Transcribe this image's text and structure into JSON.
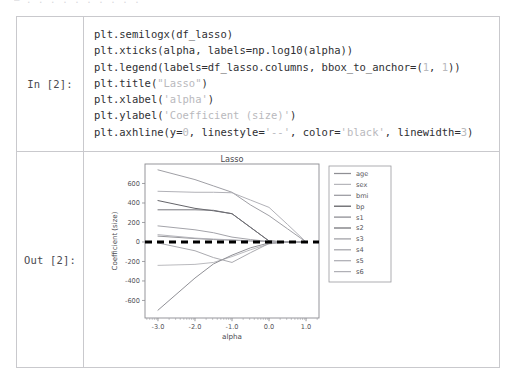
{
  "page": {
    "top_clipped_text": "— . . . . . . . . . ."
  },
  "cell": {
    "input_prompt": "In [2]:",
    "output_prompt": "Out [2]:",
    "code_lines": [
      [
        {
          "t": "plt.semilogx(df_lasso)",
          "k": "plain"
        }
      ],
      [
        {
          "t": "plt.xticks(alpha, labels=np.log10(alpha))",
          "k": "plain"
        }
      ],
      [
        {
          "t": "plt.legend(labels=df_lasso.columns, bbox_to_anchor=(",
          "k": "plain"
        },
        {
          "t": "1",
          "k": "num"
        },
        {
          "t": ", ",
          "k": "plain"
        },
        {
          "t": "1",
          "k": "num"
        },
        {
          "t": "))",
          "k": "plain"
        }
      ],
      [
        {
          "t": "plt.title(",
          "k": "plain"
        },
        {
          "t": "\"Lasso\"",
          "k": "str"
        },
        {
          "t": ")",
          "k": "plain"
        }
      ],
      [
        {
          "t": "plt.xlabel(",
          "k": "plain"
        },
        {
          "t": "'alpha'",
          "k": "str"
        },
        {
          "t": ")",
          "k": "plain"
        }
      ],
      [
        {
          "t": "plt.ylabel(",
          "k": "plain"
        },
        {
          "t": "'Coefficient (size)'",
          "k": "str"
        },
        {
          "t": ")",
          "k": "plain"
        }
      ],
      [
        {
          "t": "plt.axhline(y=",
          "k": "plain"
        },
        {
          "t": "0",
          "k": "num"
        },
        {
          "t": ", linestyle=",
          "k": "plain"
        },
        {
          "t": "'--'",
          "k": "str"
        },
        {
          "t": ", color=",
          "k": "plain"
        },
        {
          "t": "'black'",
          "k": "str"
        },
        {
          "t": ", linewidth=",
          "k": "plain"
        },
        {
          "t": "3",
          "k": "num"
        },
        {
          "t": ")",
          "k": "plain"
        }
      ]
    ]
  },
  "chart_data": {
    "type": "line",
    "title": "Lasso",
    "xlabel": "alpha",
    "ylabel": "Coefficient (size)",
    "xlim": [
      -3.35,
      1.35
    ],
    "ylim": [
      -780,
      800
    ],
    "xticks": [
      -3.0,
      -2.0,
      -1.0,
      0.0,
      1.0
    ],
    "xtick_labels": [
      "-3.0",
      "-2.0",
      "-1.0",
      "0.0",
      "1.0"
    ],
    "yticks": [
      600,
      400,
      200,
      0,
      -200,
      -400,
      -600
    ],
    "ytick_labels": [
      "600",
      "400",
      "200",
      "0",
      "-200",
      "-400",
      "-600"
    ],
    "grid": false,
    "legend_position": "upper right outside",
    "legend_labels": [
      "age",
      "sex",
      "bmi",
      "bp",
      "s1",
      "s2",
      "s3",
      "s4",
      "s5",
      "s6"
    ],
    "annotations": [
      {
        "kind": "axhline",
        "y": 0,
        "linestyle": "--",
        "color": "#000000",
        "linewidth": 3
      }
    ],
    "x": [
      -3.0,
      -2.0,
      -1.5,
      -1.0,
      -0.5,
      0.0,
      0.5,
      1.0
    ],
    "series": [
      {
        "name": "age",
        "color": "#8f8f94",
        "values": [
          60,
          35,
          25,
          18,
          10,
          4,
          0,
          0
        ]
      },
      {
        "name": "sex",
        "color": "#b6b6bb",
        "values": [
          -240,
          -230,
          -210,
          -150,
          -80,
          -20,
          0,
          0
        ]
      },
      {
        "name": "bmi",
        "color": "#9a9aa0",
        "values": [
          740,
          640,
          575,
          510,
          380,
          270,
          135,
          0
        ]
      },
      {
        "name": "bp",
        "color": "#5c5c61",
        "values": [
          425,
          345,
          320,
          290,
          150,
          10,
          0,
          0
        ]
      },
      {
        "name": "s1",
        "color": "#8a8a90",
        "values": [
          -700,
          -370,
          -225,
          -135,
          -60,
          -10,
          0,
          0
        ]
      },
      {
        "name": "s2",
        "color": "#707076",
        "values": [
          330,
          330,
          325,
          290,
          150,
          10,
          0,
          0
        ]
      },
      {
        "name": "s3",
        "color": "#9e9ea4",
        "values": [
          165,
          125,
          95,
          50,
          25,
          5,
          0,
          0
        ]
      },
      {
        "name": "s4",
        "color": "#a5a5ab",
        "values": [
          -10,
          -90,
          -160,
          -210,
          -110,
          -15,
          0,
          0
        ]
      },
      {
        "name": "s5",
        "color": "#adadb3",
        "values": [
          520,
          510,
          510,
          505,
          430,
          355,
          180,
          0
        ]
      },
      {
        "name": "s6",
        "color": "#b0b0b6",
        "values": [
          75,
          40,
          30,
          22,
          12,
          4,
          0,
          0
        ]
      }
    ]
  }
}
